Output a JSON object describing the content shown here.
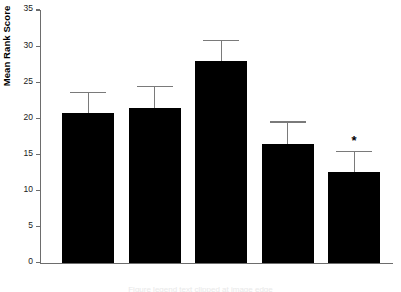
{
  "chart_data": {
    "type": "bar",
    "title": "",
    "xlabel": "",
    "ylabel": "Mean Rank Score",
    "ylim": [
      0,
      35
    ],
    "yticks": [
      0,
      5,
      10,
      15,
      20,
      25,
      30,
      35
    ],
    "grid": false,
    "legend": "none",
    "error_bars": "upper-only",
    "categories": [
      "Control",
      "Pre-Concept",
      "Concept",
      "Birth",
      "PD7 Days"
    ],
    "values": [
      20.8,
      21.4,
      28.0,
      16.4,
      12.6
    ],
    "error_upper": [
      23.5,
      24.3,
      30.7,
      19.4,
      15.3
    ],
    "annotations": [
      {
        "category": "PD7 Days",
        "symbol": "*",
        "meaning": "significant"
      }
    ],
    "bar_color": "#000000",
    "axis_color": "#6d6d6d",
    "error_color": "#7a7a7a"
  },
  "axis": {
    "y_title": "Mean Rank Score",
    "tick_labels": [
      "35",
      "30",
      "25",
      "20",
      "15",
      "10",
      "5",
      "0"
    ]
  },
  "caption": {
    "clipped_text": "Figure legend text clipped at image edge"
  }
}
